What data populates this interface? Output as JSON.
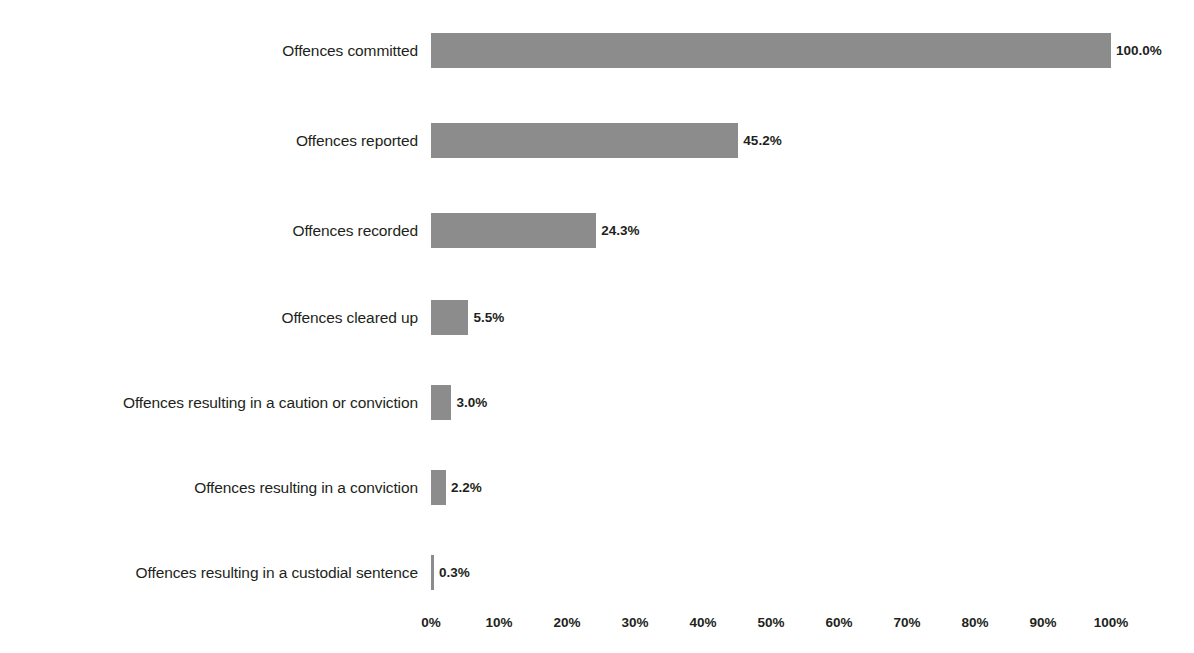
{
  "chart_data": {
    "type": "bar",
    "orientation": "horizontal",
    "title": "",
    "subtitle": "",
    "xlabel": "",
    "ylabel": "",
    "xlim": [
      0,
      100
    ],
    "grid": false,
    "legend": false,
    "bar_color": "#8c8c8c",
    "background_color": "#ffffff",
    "text_color": "#231f20",
    "categories": [
      "Offences committed",
      "Offences reported",
      "Offences recorded",
      "Offences cleared up",
      "Offences resulting in a caution or conviction",
      "Offences resulting in a conviction",
      "Offences resulting in a custodial sentence"
    ],
    "values": [
      100.0,
      45.2,
      24.3,
      5.5,
      3.0,
      2.2,
      0.3
    ],
    "value_labels": [
      "100.0%",
      "45.2%",
      "24.3%",
      "5.5%",
      "3.0%",
      "2.2%",
      "0.3%"
    ],
    "xticks": [
      0,
      10,
      20,
      30,
      40,
      50,
      60,
      70,
      80,
      90,
      100
    ],
    "xtick_labels": [
      "0%",
      "10%",
      "20%",
      "30%",
      "40%",
      "50%",
      "60%",
      "70%",
      "80%",
      "90%",
      "100%"
    ]
  }
}
